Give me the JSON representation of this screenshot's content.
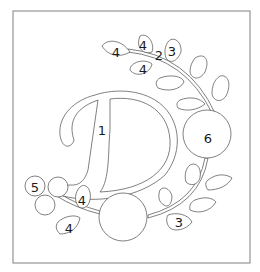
{
  "diagram": {
    "type": "appliqué pattern / paint-by-number template",
    "colors": {
      "outline": "#4a4a4a",
      "frame": "#8a8a8a",
      "fill": "#ffffff",
      "label": "#1a1a1a"
    },
    "labels": {
      "letter_d": "1",
      "stem": "2",
      "leaf_top_right": "3",
      "leaf_bottom_right": "3",
      "leaf_top_left": "4",
      "leaf_top_middle": "4",
      "leaf_top_lower": "4",
      "leaf_left_upper": "4",
      "leaf_left_lower": "4",
      "small_circle": "5",
      "big_circle_right": "6"
    }
  }
}
